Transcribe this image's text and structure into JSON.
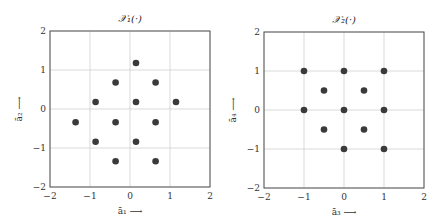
{
  "chart_data": [
    {
      "type": "scatter",
      "title": "𝒳₁(·)",
      "xlabel": "ā₁ ⟶",
      "ylabel": "ā₂ ⟶",
      "xlim": [
        -2,
        2
      ],
      "ylim": [
        -2,
        2
      ],
      "xticks": [
        -2,
        -1,
        0,
        1,
        2
      ],
      "yticks": [
        -2,
        -1,
        0,
        1,
        2
      ],
      "grid": true,
      "frame": {
        "x0": 50,
        "y0": 31,
        "x1": 210,
        "y1": 187
      },
      "points": [
        {
          "x": 0.15,
          "y": 1.18
        },
        {
          "x": -0.36,
          "y": 0.68
        },
        {
          "x": 0.64,
          "y": 0.68
        },
        {
          "x": -0.86,
          "y": 0.18
        },
        {
          "x": 0.15,
          "y": 0.18
        },
        {
          "x": 1.15,
          "y": 0.18
        },
        {
          "x": -1.36,
          "y": -0.34
        },
        {
          "x": -0.36,
          "y": -0.34
        },
        {
          "x": 0.64,
          "y": -0.34
        },
        {
          "x": -0.86,
          "y": -0.84
        },
        {
          "x": 0.15,
          "y": -0.84
        },
        {
          "x": -0.36,
          "y": -1.34
        },
        {
          "x": 0.64,
          "y": -1.34
        }
      ]
    },
    {
      "type": "scatter",
      "title": "𝒳₂(·)",
      "xlabel": "ā₃ ⟶",
      "ylabel": "ā₄ ⟶",
      "xlim": [
        -2,
        2
      ],
      "ylim": [
        -2,
        2
      ],
      "xticks": [
        -2,
        -1,
        0,
        1,
        2
      ],
      "yticks": [
        -2,
        -1,
        0,
        1,
        2
      ],
      "grid": true,
      "frame": {
        "x0": 264,
        "y0": 32,
        "x1": 424,
        "y1": 188
      },
      "points": [
        {
          "x": -1,
          "y": 1
        },
        {
          "x": 0,
          "y": 1
        },
        {
          "x": 1,
          "y": 1
        },
        {
          "x": -0.5,
          "y": 0.5
        },
        {
          "x": 0.5,
          "y": 0.5
        },
        {
          "x": -1,
          "y": 0
        },
        {
          "x": 0,
          "y": 0
        },
        {
          "x": 1,
          "y": 0
        },
        {
          "x": -0.5,
          "y": -0.5
        },
        {
          "x": 0.5,
          "y": -0.5
        },
        {
          "x": 0,
          "y": -1
        },
        {
          "x": 1,
          "y": -1
        }
      ]
    }
  ],
  "style": {
    "point_color": "#3a3a3a",
    "grid_color": "#cfcfcf",
    "frame_color": "#555555",
    "point_radius": 3.3
  }
}
